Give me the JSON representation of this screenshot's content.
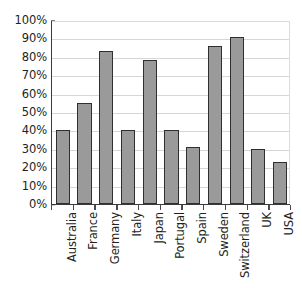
{
  "chart_data": {
    "type": "bar",
    "title": "",
    "subtitle": "",
    "xlabel": "",
    "ylabel": "",
    "ylim": [
      0,
      100
    ],
    "y_ticks": [
      "0%",
      "10%",
      "20%",
      "30%",
      "40%",
      "50%",
      "60%",
      "70%",
      "80%",
      "90%",
      "100%"
    ],
    "y_tick_values": [
      0,
      10,
      20,
      30,
      40,
      50,
      60,
      70,
      80,
      90,
      100
    ],
    "grid": "horizontal",
    "legend": "none",
    "categories": [
      "Australia",
      "France",
      "Germany",
      "Italy",
      "Japan",
      "Portugal",
      "Spain",
      "Sweden",
      "Switzerland",
      "UK",
      "USA"
    ],
    "values": [
      40,
      55,
      83,
      40,
      78,
      40,
      31,
      86,
      91,
      30,
      23
    ],
    "bar_fill_color": "#9a9a9a",
    "bar_edge_color": "#2f2f2f",
    "axis_color": "#3b3b3b",
    "gridline_color": "#d6d6d6",
    "background_color": "#ffffff"
  }
}
